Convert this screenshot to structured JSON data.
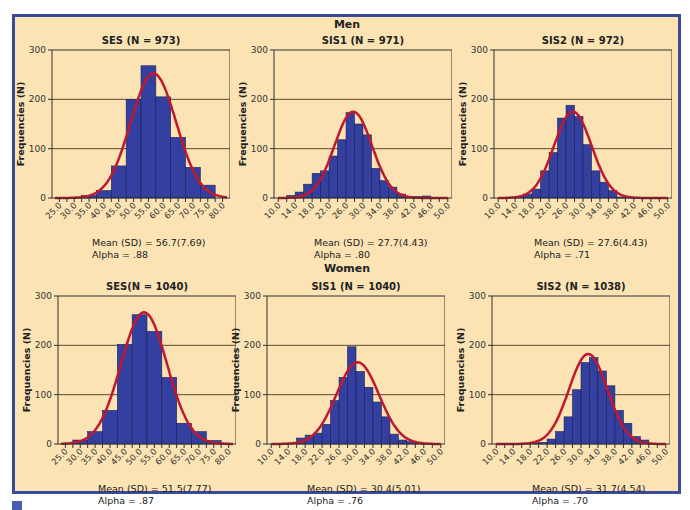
{
  "groups": {
    "men": "Men",
    "women": "Women"
  },
  "colors": {
    "background": "#fbe3b4",
    "border": "#3b4a9a",
    "bar": "#3340a0",
    "curve": "#c0182e",
    "grid": "#5a4a30"
  },
  "chart_data": [
    {
      "type": "bar",
      "group": "Men",
      "title": "SES (N = 973)",
      "ylabel": "Frequencies (N)",
      "ylim": [
        0,
        300
      ],
      "yticks": [
        0,
        100,
        200,
        300
      ],
      "xticks": [
        "25.0",
        "30.0",
        "35.0",
        "40.0",
        "45.0",
        "50.0",
        "55.0",
        "60.0",
        "65.0",
        "70.0",
        "75.0",
        "80.0"
      ],
      "xrange": [
        22.5,
        82.5
      ],
      "bin_width": 5,
      "bins_start": [
        32.5,
        37.5,
        42.5,
        47.5,
        52.5,
        57.5,
        62.5,
        67.5,
        72.5
      ],
      "values": [
        5,
        15,
        65,
        200,
        268,
        205,
        123,
        62,
        26
      ],
      "mean": 56.7,
      "sd": 7.69,
      "n": 973,
      "stats": "Mean (SD) = 56.7(7.69)",
      "alpha": "Alpha = .88"
    },
    {
      "type": "bar",
      "group": "Men",
      "title": "SIS1 (N = 971)",
      "ylabel": "Frequencies (N)",
      "ylim": [
        0,
        300
      ],
      "yticks": [
        0,
        100,
        200,
        300
      ],
      "xticks": [
        "10.0",
        "14.0",
        "18.0",
        "22.0",
        "26.0",
        "30.0",
        "34.0",
        "38.0",
        "42.0",
        "46.0",
        "50.0"
      ],
      "xrange": [
        9,
        51
      ],
      "bin_width": 2,
      "bins_start": [
        12,
        14,
        16,
        18,
        20,
        22,
        24,
        26,
        28,
        30,
        32,
        34,
        36,
        38,
        40,
        42,
        44
      ],
      "values": [
        5,
        12,
        28,
        50,
        55,
        85,
        118,
        173,
        150,
        128,
        60,
        35,
        22,
        8,
        3,
        3,
        4
      ],
      "mean": 27.7,
      "sd": 4.43,
      "n": 971,
      "stats": "Mean (SD) = 27.7(4.43)",
      "alpha": "Alpha = .80"
    },
    {
      "type": "bar",
      "group": "Men",
      "title": "SIS2 (N = 972)",
      "ylabel": "Frequencies (N)",
      "ylim": [
        0,
        300
      ],
      "yticks": [
        0,
        100,
        200,
        300
      ],
      "xticks": [
        "10.0",
        "14.0",
        "18.0",
        "22.0",
        "26.0",
        "30.0",
        "34.0",
        "38.0",
        "42.0",
        "46.0",
        "50.0"
      ],
      "xrange": [
        9,
        51
      ],
      "bin_width": 2,
      "bins_start": [
        14,
        16,
        18,
        20,
        22,
        24,
        26,
        28,
        30,
        32,
        34,
        36,
        38,
        40
      ],
      "values": [
        3,
        8,
        18,
        55,
        92,
        162,
        188,
        165,
        108,
        55,
        32,
        15,
        2,
        1
      ],
      "mean": 27.6,
      "sd": 4.43,
      "n": 972,
      "stats": "Mean (SD) = 27.6(4.43)",
      "alpha": "Alpha = .71"
    },
    {
      "type": "bar",
      "group": "Women",
      "title": "SES(N = 1040)",
      "ylabel": "Frequencies (N)",
      "ylim": [
        0,
        300
      ],
      "yticks": [
        0,
        100,
        200,
        300
      ],
      "xticks": [
        "25.0",
        "30.0",
        "35.0",
        "40.0",
        "45.0",
        "50.0",
        "55.0",
        "60.0",
        "65.0",
        "70.0",
        "75.0",
        "80.0"
      ],
      "xrange": [
        22.5,
        82.5
      ],
      "bin_width": 5,
      "bins_start": [
        27.5,
        32.5,
        37.5,
        42.5,
        47.5,
        52.5,
        57.5,
        62.5,
        67.5,
        72.5
      ],
      "values": [
        8,
        25,
        68,
        202,
        262,
        228,
        135,
        42,
        25,
        7
      ],
      "mean": 51.5,
      "sd": 7.77,
      "n": 1040,
      "stats": "Mean (SD) = 51.5(7.77)",
      "alpha": "Alpha = .87"
    },
    {
      "type": "bar",
      "group": "Women",
      "title": "SIS1 (N = 1040)",
      "ylabel": "Frequencies (N)",
      "ylim": [
        0,
        300
      ],
      "yticks": [
        0,
        100,
        200,
        300
      ],
      "xticks": [
        "10.0",
        "14.0",
        "18.0",
        "22.0",
        "26.0",
        "30.0",
        "34.0",
        "38.0",
        "42.0",
        "46.0",
        "50.0"
      ],
      "xrange": [
        9,
        51
      ],
      "bin_width": 2,
      "bins_start": [
        16,
        18,
        20,
        22,
        24,
        26,
        28,
        30,
        32,
        34,
        36,
        38,
        40,
        42,
        44
      ],
      "values": [
        12,
        18,
        22,
        40,
        88,
        135,
        197,
        147,
        115,
        85,
        55,
        20,
        8,
        5,
        2
      ],
      "mean": 30.4,
      "sd": 5.01,
      "n": 1040,
      "stats": "Mean (SD) = 30.4(5.01)",
      "alpha": "Alpha = .76"
    },
    {
      "type": "bar",
      "group": "Women",
      "title": "SIS2 (N = 1038)",
      "ylabel": "Frequencies (N)",
      "ylim": [
        0,
        300
      ],
      "yticks": [
        0,
        100,
        200,
        300
      ],
      "xticks": [
        "10.0",
        "14.0",
        "18.0",
        "22.0",
        "26.0",
        "30.0",
        "34.0",
        "38.0",
        "42.0",
        "46.0",
        "50.0"
      ],
      "xrange": [
        9,
        51
      ],
      "bin_width": 2,
      "bins_start": [
        18,
        20,
        22,
        24,
        26,
        28,
        30,
        32,
        34,
        36,
        38,
        40,
        42,
        44
      ],
      "values": [
        2,
        3,
        10,
        25,
        55,
        110,
        165,
        175,
        148,
        118,
        68,
        42,
        15,
        8
      ],
      "mean": 31.7,
      "sd": 4.54,
      "n": 1038,
      "stats": "Mean (SD) = 31.7(4.54)",
      "alpha": "Alpha = .70"
    }
  ]
}
